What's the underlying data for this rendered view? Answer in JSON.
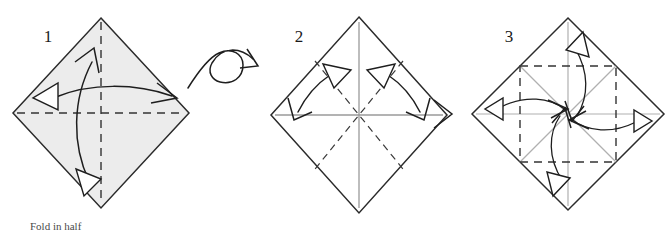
{
  "figure": {
    "kind": "origami-instruction-diagram",
    "background_color": "#ffffff",
    "width": 671,
    "height": 231,
    "caption": "Fold in half"
  },
  "colors": {
    "paper_shaded_fill": "#ececec",
    "paper_white_fill": "#ffffff",
    "paper_edge": "#2b2b2b",
    "crease_dashed": "#333333",
    "crease_gray": "#9a9a9a",
    "arrow": "#1e1e1e",
    "label": "#1a1a1a"
  },
  "steps": [
    {
      "number": "1",
      "label_x": 48,
      "label_y": 42,
      "shape": "diamond",
      "face": "shaded",
      "center": {
        "x": 101,
        "y": 113
      },
      "half_width": 88,
      "half_height": 95,
      "creases": [
        {
          "name": "vertical-center-crease",
          "style": "dashed"
        },
        {
          "name": "horizontal-center-crease",
          "style": "dashed"
        }
      ],
      "arrows": [
        {
          "name": "horizontal-double-arrow",
          "direction": "horizontal",
          "head_left": "hollow-triangle",
          "head_right": "open-v"
        },
        {
          "name": "vertical-double-arrow",
          "direction": "vertical",
          "head_top": "open-v",
          "head_bottom": "hollow-triangle"
        }
      ]
    },
    {
      "number": "2",
      "label_x": 299,
      "label_y": 42,
      "shape": "diamond",
      "face": "white",
      "center": {
        "x": 359,
        "y": 115
      },
      "half_width": 88,
      "half_height": 95,
      "creases": [
        {
          "name": "vertical-center-crease",
          "style": "solid-gray"
        },
        {
          "name": "horizontal-center-crease",
          "style": "solid-gray"
        },
        {
          "name": "diagonal-crease-nw-se",
          "style": "dashed"
        },
        {
          "name": "diagonal-crease-ne-sw",
          "style": "dashed"
        }
      ],
      "arrows": [
        {
          "name": "left-double-arrow",
          "head_upper": "hollow-triangle",
          "head_lower": "open-v"
        },
        {
          "name": "right-double-arrow",
          "head_upper": "hollow-triangle",
          "head_lower": "open-v"
        }
      ]
    },
    {
      "number": "3",
      "label_x": 509,
      "label_y": 42,
      "shape": "diamond",
      "face": "white",
      "center": {
        "x": 568,
        "y": 114
      },
      "half_width": 96,
      "half_height": 96,
      "creases": [
        {
          "name": "inner-square-crease",
          "style": "dashed"
        },
        {
          "name": "vertical-center-crease",
          "style": "solid-gray"
        },
        {
          "name": "horizontal-center-crease",
          "style": "solid-gray"
        },
        {
          "name": "diagonal-crease-nw-se",
          "style": "solid-gray"
        },
        {
          "name": "diagonal-crease-ne-sw",
          "style": "solid-gray"
        }
      ],
      "arrows": [
        {
          "name": "arrow-to-center-from-top",
          "head_outer": "hollow-triangle",
          "head_inner": "open-v"
        },
        {
          "name": "arrow-to-center-from-bottom",
          "head_outer": "hollow-triangle",
          "head_inner": "open-v"
        },
        {
          "name": "arrow-to-center-from-left",
          "head_outer": "hollow-triangle",
          "head_inner": "open-v"
        },
        {
          "name": "arrow-to-center-from-right",
          "head_outer": "hollow-triangle",
          "head_inner": "open-v"
        }
      ]
    }
  ],
  "symbols": [
    {
      "name": "turn-over-symbol",
      "between_steps": "1-2",
      "x": 183,
      "y": 38,
      "description": "looping arrow indicating turn the paper over"
    },
    {
      "name": "proceed-chevron",
      "between_steps": "2-3",
      "x": 437,
      "y": 114,
      "description": "chevron arrowhead pointing right"
    }
  ]
}
